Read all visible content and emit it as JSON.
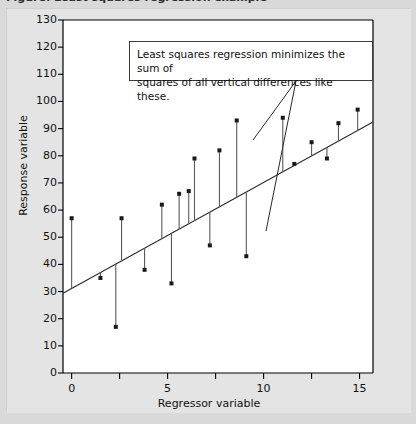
{
  "caption": {
    "text": "Figure: Least squares regression example"
  },
  "axes": {
    "y_title": "Response variable",
    "x_title": "Regressor variable",
    "y_ticks": [
      "0",
      "10",
      "20",
      "30",
      "40",
      "50",
      "60",
      "70",
      "80",
      "90",
      "100",
      "110",
      "120",
      "130"
    ],
    "x_ticks": [
      "0",
      "5",
      "10",
      "15"
    ]
  },
  "annotation": {
    "line1": "Least squares regression minimizes the sum of",
    "line2": "squares of all vertical differences like these."
  },
  "colors": {
    "figure_background": "#e4e4e4",
    "plot_background": "#ffffff",
    "axis": "#000000",
    "marker": "#1a1a1a",
    "residual": "#5a5a5a",
    "fit_line": "#2b2b2b",
    "annotation_border": "#3a3a3a",
    "page_background": "#d9d9d9"
  },
  "chart_data": {
    "type": "scatter",
    "title": "",
    "xlabel": "Regressor variable",
    "ylabel": "Response variable",
    "xlim": [
      -0.45,
      15.7
    ],
    "ylim": [
      0,
      130
    ],
    "xticks": [
      0,
      5,
      10,
      15
    ],
    "xticks_minor": [
      2.5,
      7.5,
      12.5
    ],
    "yticks": [
      0,
      10,
      20,
      30,
      40,
      50,
      60,
      70,
      80,
      90,
      100,
      110,
      120,
      130
    ],
    "grid": false,
    "legend": null,
    "fit_line": {
      "label": "least squares regression line",
      "intercept": 31.2,
      "slope": 3.9,
      "x_start": -0.45,
      "x_end": 15.7,
      "y_start": 29.4,
      "y_end": 92.4
    },
    "residual_stems": true,
    "points": [
      {
        "x": 0.0,
        "y": 57,
        "fit": 31.2,
        "residual": 25.8
      },
      {
        "x": 1.5,
        "y": 35,
        "fit": 37.1,
        "residual": -2.1
      },
      {
        "x": 2.3,
        "y": 17,
        "fit": 40.2,
        "residual": -23.2
      },
      {
        "x": 2.6,
        "y": 57,
        "fit": 41.3,
        "residual": 15.7
      },
      {
        "x": 3.8,
        "y": 38,
        "fit": 46.0,
        "residual": -8.0
      },
      {
        "x": 4.7,
        "y": 62,
        "fit": 49.5,
        "residual": 12.5
      },
      {
        "x": 5.2,
        "y": 33,
        "fit": 51.5,
        "residual": -18.5
      },
      {
        "x": 5.6,
        "y": 66,
        "fit": 53.0,
        "residual": 13.0
      },
      {
        "x": 6.1,
        "y": 67,
        "fit": 55.0,
        "residual": 12.0
      },
      {
        "x": 6.4,
        "y": 79,
        "fit": 56.2,
        "residual": 22.8
      },
      {
        "x": 7.2,
        "y": 47,
        "fit": 59.3,
        "residual": -12.3
      },
      {
        "x": 7.7,
        "y": 82,
        "fit": 61.2,
        "residual": 20.8
      },
      {
        "x": 8.6,
        "y": 93,
        "fit": 64.7,
        "residual": 28.3
      },
      {
        "x": 9.1,
        "y": 43,
        "fit": 66.7,
        "residual": -23.7
      },
      {
        "x": 11.0,
        "y": 94,
        "fit": 74.1,
        "residual": 19.9
      },
      {
        "x": 11.6,
        "y": 77,
        "fit": 76.4,
        "residual": 0.6
      },
      {
        "x": 12.5,
        "y": 85,
        "fit": 79.9,
        "residual": 5.1
      },
      {
        "x": 13.3,
        "y": 79,
        "fit": 83.1,
        "residual": -4.1
      },
      {
        "x": 13.9,
        "y": 92,
        "fit": 85.4,
        "residual": 6.6
      },
      {
        "x": 14.9,
        "y": 97,
        "fit": 89.3,
        "residual": 7.7
      }
    ],
    "annotations": [
      {
        "text": "Least squares regression minimizes the sum of squares of all vertical differences like these.",
        "box": {
          "x0": 128,
          "y0": 40,
          "x1": 372,
          "y1": 80
        },
        "leaders": [
          {
            "from_x": 295,
            "from_y": 80,
            "to_x": 252,
            "to_y": 139
          },
          {
            "from_x": 295,
            "from_y": 80,
            "to_x": 265,
            "to_y": 230
          }
        ]
      }
    ]
  }
}
